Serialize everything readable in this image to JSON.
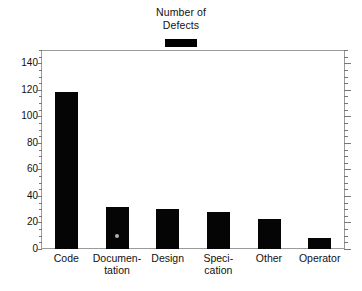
{
  "chart_data": {
    "type": "bar",
    "title": "Number of Defects",
    "title_lines": [
      "Number of",
      "Defects"
    ],
    "xlabel": "",
    "ylabel": "",
    "categories": [
      "Code",
      "Documentation",
      "Design",
      "Specification",
      "Other",
      "Operator"
    ],
    "category_label_lines": [
      [
        "Code",
        ""
      ],
      [
        "Documen-",
        "tation"
      ],
      [
        "Design",
        ""
      ],
      [
        "Speci-",
        "cation"
      ],
      [
        "Other",
        ""
      ],
      [
        "Operator",
        ""
      ]
    ],
    "values": [
      118,
      32,
      30,
      28,
      23,
      8
    ],
    "ylim": [
      0,
      150
    ],
    "y_ticks": [
      0,
      20,
      40,
      60,
      80,
      100,
      120,
      140
    ],
    "y_tick_labels": [
      "0",
      "20",
      "40",
      "60",
      "80",
      "100",
      "120",
      "140"
    ],
    "y_minor_tick_step": 5,
    "grid": false,
    "legend": {
      "position": "top-center",
      "entries": [
        {
          "label": "Number of Defects",
          "color": "#000000"
        }
      ]
    },
    "series": [
      {
        "name": "Number of Defects",
        "color": "#000000",
        "values": [
          118,
          32,
          30,
          28,
          23,
          8
        ]
      }
    ]
  },
  "colors": {
    "bar": "#050505",
    "frame": "#9a9a9a",
    "tick": "#777777",
    "text": "#111111",
    "background": "#ffffff"
  }
}
